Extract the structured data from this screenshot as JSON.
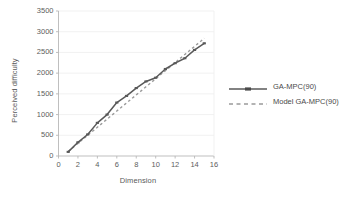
{
  "chart_data": {
    "type": "line",
    "title": "",
    "xlabel": "Dimension",
    "ylabel": "Perceived difficulty",
    "xlim": [
      0,
      16
    ],
    "ylim": [
      0,
      3500
    ],
    "xticks": [
      0,
      2,
      4,
      6,
      8,
      10,
      12,
      14,
      16
    ],
    "yticks": [
      0,
      500,
      1000,
      1500,
      2000,
      2500,
      3000,
      3500
    ],
    "grid": "horizontal",
    "legend_position": "right",
    "x": [
      1,
      2,
      3,
      4,
      5,
      6,
      7,
      8,
      9,
      10,
      11,
      12,
      13,
      14,
      15
    ],
    "series": [
      {
        "name": "GA-MPC(90)",
        "style": "solid",
        "color": "#595959",
        "marker": "dash",
        "values": [
          100,
          330,
          520,
          800,
          1000,
          1290,
          1450,
          1640,
          1800,
          1890,
          2100,
          2240,
          2360,
          2560,
          2720
        ]
      },
      {
        "name": "Model GA-MPC(90)",
        "style": "dashed",
        "color": "#9a9a9a",
        "marker": "none",
        "values": [
          110,
          305,
          500,
          695,
          890,
          1085,
          1280,
          1475,
          1670,
          1865,
          2060,
          2255,
          2450,
          2645,
          2840
        ]
      }
    ]
  },
  "axes": {
    "x_title": "Dimension",
    "y_title": "Perceived difficulty",
    "x_tick_labels": [
      "0",
      "2",
      "4",
      "6",
      "8",
      "10",
      "12",
      "14",
      "16"
    ],
    "y_tick_labels": [
      "0",
      "500",
      "1000",
      "1500",
      "2000",
      "2500",
      "3000",
      "3500"
    ]
  },
  "legend": {
    "items": [
      {
        "label": "GA-MPC(90)"
      },
      {
        "label": "Model GA-MPC(90)"
      }
    ]
  },
  "colors": {
    "series_solid": "#595959",
    "series_dashed": "#9a9a9a",
    "axis": "#b8b8b8",
    "grid": "#efefef",
    "text": "#595959",
    "background": "#ffffff"
  }
}
